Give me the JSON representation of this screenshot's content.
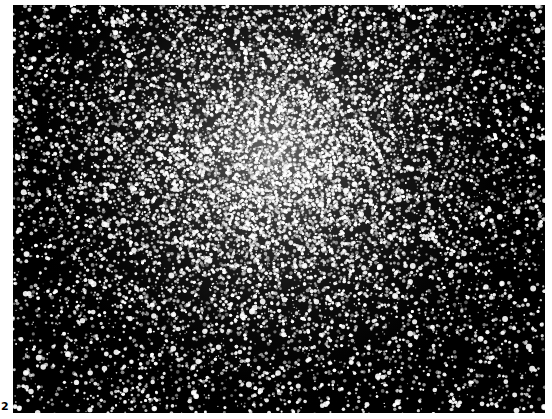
{
  "figure": {
    "label": "2",
    "icon": "star-field-photograph"
  }
}
